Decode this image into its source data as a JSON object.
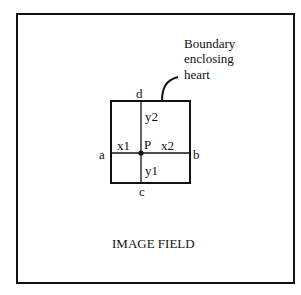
{
  "diagram": {
    "outer_label": "IMAGE FIELD",
    "callout": {
      "lines": [
        "Boundary",
        "enclosing",
        "heart"
      ]
    },
    "corner_labels": {
      "top": "d",
      "bottom": "c",
      "left": "a",
      "right": "b"
    },
    "segment_labels": {
      "x1": "x1",
      "x2": "x2",
      "y1": "y1",
      "y2": "y2"
    },
    "point_label": "P",
    "colors": {
      "stroke": "#111111",
      "background": "#ffffff"
    }
  }
}
